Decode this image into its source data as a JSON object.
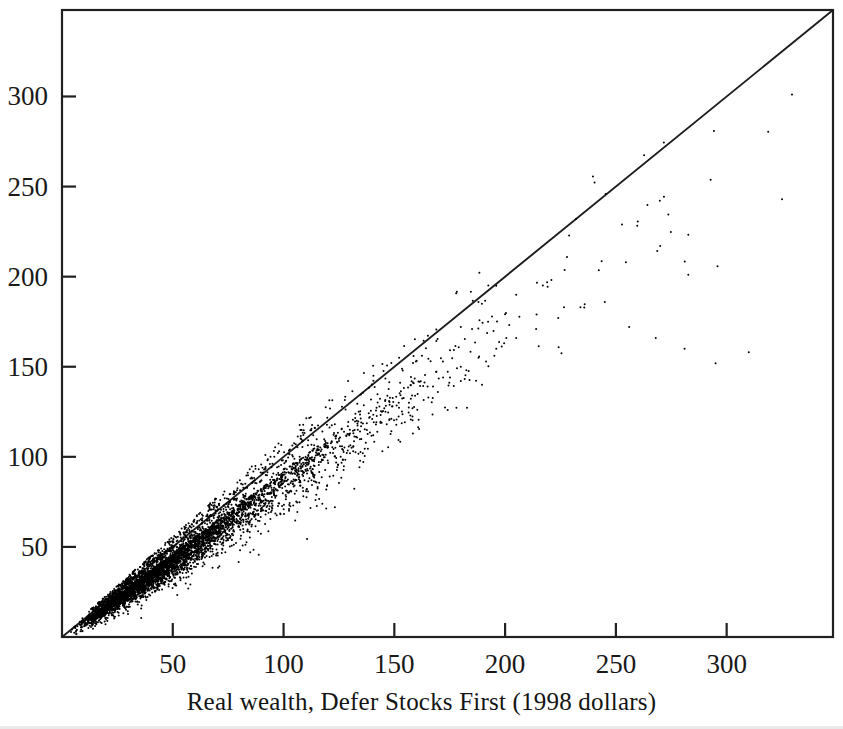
{
  "figure": {
    "caption": "Real wealth, Defer Stocks First (1998 dollars)",
    "background_color": "#ffffff",
    "ink_color": "#191919"
  },
  "chart_data": {
    "type": "scatter",
    "title": "",
    "xlabel": "Real wealth, Defer Stocks First (1998 dollars)",
    "ylabel": "",
    "xlim": [
      0,
      348
    ],
    "ylim": [
      0,
      348
    ],
    "grid": false,
    "legend": null,
    "x_ticks": [
      50,
      100,
      150,
      200,
      250,
      300
    ],
    "x_tick_labels": [
      "50",
      "100",
      "150",
      "200",
      "250",
      "300"
    ],
    "y_ticks": [
      50,
      100,
      150,
      200,
      250,
      300
    ],
    "y_tick_labels": [
      "50",
      "100",
      "150",
      "200",
      "250",
      "300"
    ],
    "reference_line": {
      "name": "identity-line",
      "description": "45 degree y = x line from origin to upper right corner",
      "from": [
        0,
        0
      ],
      "to": [
        348,
        348
      ],
      "slope": 1,
      "intercept": 0
    },
    "marker": {
      "shape": "point",
      "size_px": 2,
      "color": "#000000"
    },
    "n_points": 5200,
    "distribution_notes": "Dense elongated cloud along the y = x direction; mass concentrated below the identity line (y < x). Density very high for x below 90, fanning out and thinning for larger x. A handful of isolated outliers appear at x between 190 and 330 with y well below x.",
    "cloud_model": {
      "x_min": 2,
      "x_mode": 48,
      "x_tail_max": 330,
      "slope_mean": 0.92,
      "spread_base": 1.6,
      "spread_growth": 0.1,
      "below_line_bias": 0.62
    },
    "points": [
      [
        6,
        6
      ],
      [
        8,
        7
      ],
      [
        9,
        9
      ],
      [
        11,
        10
      ],
      [
        12,
        12
      ],
      [
        13,
        11
      ],
      [
        15,
        14
      ],
      [
        16,
        15
      ],
      [
        18,
        17
      ],
      [
        19,
        16
      ],
      [
        21,
        20
      ],
      [
        22,
        21
      ],
      [
        24,
        22
      ],
      [
        25,
        24
      ],
      [
        27,
        25
      ],
      [
        29,
        27
      ],
      [
        30,
        29
      ],
      [
        32,
        30
      ],
      [
        34,
        31
      ],
      [
        35,
        34
      ],
      [
        37,
        35
      ],
      [
        38,
        34
      ],
      [
        40,
        38
      ],
      [
        42,
        39
      ],
      [
        44,
        41
      ],
      [
        45,
        43
      ],
      [
        47,
        44
      ],
      [
        49,
        46
      ],
      [
        51,
        47
      ],
      [
        52,
        50
      ],
      [
        54,
        51
      ],
      [
        56,
        52
      ],
      [
        58,
        55
      ],
      [
        60,
        56
      ],
      [
        62,
        57
      ],
      [
        64,
        60
      ],
      [
        66,
        61
      ],
      [
        68,
        63
      ],
      [
        70,
        65
      ],
      [
        72,
        66
      ],
      [
        75,
        69
      ],
      [
        77,
        70
      ],
      [
        80,
        73
      ],
      [
        82,
        75
      ],
      [
        85,
        77
      ],
      [
        88,
        80
      ],
      [
        91,
        82
      ],
      [
        94,
        85
      ],
      [
        97,
        87
      ],
      [
        100,
        90
      ],
      [
        104,
        93
      ],
      [
        108,
        96
      ],
      [
        112,
        99
      ],
      [
        116,
        102
      ],
      [
        120,
        106
      ],
      [
        125,
        110
      ],
      [
        130,
        113
      ],
      [
        135,
        117
      ],
      [
        140,
        121
      ],
      [
        146,
        125
      ],
      [
        152,
        130
      ],
      [
        158,
        134
      ],
      [
        165,
        139
      ],
      [
        172,
        144
      ],
      [
        180,
        150
      ],
      [
        188,
        155
      ],
      [
        196,
        160
      ],
      [
        205,
        166
      ],
      [
        214,
        171
      ],
      [
        224,
        177
      ],
      [
        234,
        183
      ],
      [
        245,
        186
      ],
      [
        256,
        172
      ],
      [
        268,
        166
      ],
      [
        281,
        160
      ],
      [
        295,
        152
      ],
      [
        310,
        158
      ],
      [
        325,
        243
      ],
      [
        270,
        217
      ],
      [
        232,
        232
      ],
      [
        205,
        190
      ],
      [
        196,
        195
      ],
      [
        188,
        186
      ],
      [
        180,
        172
      ]
    ]
  }
}
